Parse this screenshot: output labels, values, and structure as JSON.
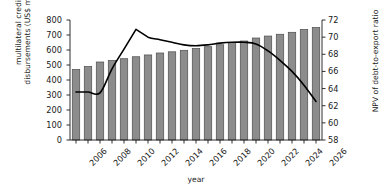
{
  "chart_data": {
    "type": "bar",
    "title": "",
    "xlabel": "year",
    "ylabel": "multilateral credit disbursements (US$ million)",
    "ylabel_right": "NPV of debt-to-export ratio",
    "grid": false,
    "legend": "none",
    "x": [
      2006,
      2007,
      2008,
      2009,
      2010,
      2011,
      2012,
      2013,
      2014,
      2015,
      2016,
      2017,
      2018,
      2019,
      2020,
      2021,
      2022,
      2023,
      2024,
      2025,
      2026
    ],
    "categories": [
      "2006",
      "2007",
      "2008",
      "2009",
      "2010",
      "2011",
      "2012",
      "2013",
      "2014",
      "2015",
      "2016",
      "2017",
      "2018",
      "2019",
      "2020",
      "2021",
      "2022",
      "2023",
      "2024",
      "2025",
      "2026"
    ],
    "ylim": [
      0,
      800
    ],
    "ylim_right": [
      58,
      72
    ],
    "xlim": [
      2005.5,
      2026.5
    ],
    "yticks": [
      0,
      100,
      200,
      300,
      400,
      500,
      600,
      700,
      800
    ],
    "yticks_right": [
      58,
      60,
      62,
      64,
      66,
      68,
      70,
      72
    ],
    "xticks": [
      2006,
      2008,
      2010,
      2012,
      2014,
      2016,
      2018,
      2020,
      2022,
      2024,
      2026
    ],
    "xticklabels": [
      "2006",
      "2008",
      "2010",
      "2012",
      "2014",
      "2016",
      "2018",
      "2020",
      "2022",
      "2024",
      "2026"
    ],
    "series": [
      {
        "name": "multilateral credit disbursements (US$ million)",
        "type": "bar",
        "axis": "left",
        "color": "#8c8c8c",
        "edge_color": "#4d4d4d",
        "values": [
          470,
          490,
          520,
          530,
          542,
          555,
          567,
          580,
          588,
          598,
          610,
          622,
          635,
          650,
          660,
          680,
          693,
          705,
          718,
          737,
          750
        ]
      },
      {
        "name": "NPV of debt-to-export ratio",
        "type": "line",
        "axis": "right",
        "color": "#000000",
        "values": [
          63.6,
          63.6,
          63.5,
          66.3,
          68.6,
          70.9,
          70.0,
          69.7,
          69.4,
          69.1,
          69.0,
          69.1,
          69.3,
          69.4,
          69.4,
          69.2,
          68.4,
          67.3,
          66.0,
          64.4,
          62.5
        ]
      }
    ]
  },
  "axes": {
    "left_title_line1": "multilateral credit",
    "left_title_line2": "disbursements (US$ million)",
    "right_title": "NPV of debt-to-export ratio",
    "x_title": "year"
  }
}
